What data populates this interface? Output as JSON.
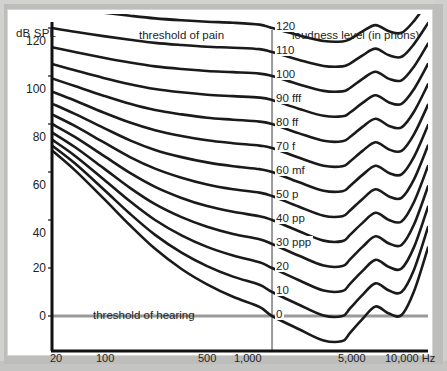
{
  "figure": {
    "axis_title_y": "dB SPL",
    "annotation_pain": "threshold of pain",
    "annotation_hearing": "threshold of hearing",
    "legend_title": "loudness level (in phons)",
    "colors": {
      "curve": "#1a1a1a",
      "axis": "#111111",
      "guide": "#9a9a9a",
      "plate": "#ffffff",
      "surround": "#c9c9c7",
      "text": "#232323"
    }
  },
  "chart_data": {
    "type": "line",
    "title": "",
    "subtitle": "",
    "xlabel": "",
    "ylabel": "dB SPL",
    "xscale": "log",
    "xlim": [
      20,
      16000
    ],
    "ylim": [
      -10,
      130
    ],
    "grid": false,
    "legend_position": "inline-right",
    "annotations": [
      {
        "text": "threshold of pain",
        "x": 260,
        "y": 125
      },
      {
        "text": "threshold of hearing",
        "x": 200,
        "y": 3
      },
      {
        "text": "loudness level (in phons)",
        "x": 3000,
        "y": 128
      }
    ],
    "xticks": [
      20,
      100,
      500,
      1000,
      5000,
      10000
    ],
    "xticklabels": [
      "20",
      "100",
      "500",
      "1,000",
      "5,000",
      "10,000 Hz"
    ],
    "yticks": [
      0,
      20,
      40,
      60,
      80,
      100,
      120
    ],
    "yticklabels": [
      "0",
      "20",
      "40",
      "60",
      "80",
      "100",
      "120"
    ],
    "guide_line_y": 0,
    "guide_line_x": 1000,
    "series": [
      {
        "name": "120",
        "label": "120",
        "dynamic": "",
        "phon": 120,
        "x": [
          20,
          30,
          50,
          80,
          125,
          200,
          315,
          500,
          800,
          1000,
          1600,
          2500,
          3500,
          4000,
          5000,
          6300,
          8000,
          10000,
          12500,
          16000
        ],
        "y": [
          129.5,
          128.0,
          126.4,
          125.1,
          124.0,
          123.2,
          122.6,
          122.2,
          121.4,
          120.0,
          117.0,
          114.6,
          114.4,
          115.4,
          118.6,
          121.2,
          118.6,
          118.0,
          123.0,
          131.0
        ]
      },
      {
        "name": "110",
        "label": "110",
        "dynamic": "",
        "phon": 110,
        "x": [
          20,
          30,
          50,
          80,
          125,
          200,
          315,
          500,
          800,
          1000,
          1600,
          2500,
          3500,
          4000,
          5000,
          6300,
          8000,
          10000,
          12500,
          16000
        ],
        "y": [
          120.0,
          118.4,
          116.6,
          115.1,
          113.8,
          112.9,
          112.2,
          111.8,
          111.2,
          110.0,
          106.8,
          104.2,
          104.0,
          105.2,
          108.6,
          111.4,
          108.6,
          108.0,
          113.4,
          122.0
        ]
      },
      {
        "name": "100",
        "label": "100",
        "dynamic": "",
        "phon": 100,
        "x": [
          20,
          30,
          50,
          80,
          125,
          200,
          315,
          500,
          800,
          1000,
          1600,
          2500,
          3500,
          4000,
          5000,
          6300,
          8000,
          10000,
          12500,
          16000
        ],
        "y": [
          112.0,
          110.0,
          107.6,
          105.6,
          104.0,
          102.9,
          102.1,
          101.6,
          101.0,
          100.0,
          96.6,
          93.8,
          93.6,
          95.0,
          98.8,
          101.8,
          98.8,
          98.2,
          104.0,
          113.5
        ]
      },
      {
        "name": "90",
        "label": "90 fff",
        "dynamic": "fff",
        "phon": 90,
        "x": [
          20,
          30,
          50,
          80,
          125,
          200,
          315,
          500,
          800,
          1000,
          1600,
          2500,
          3500,
          4000,
          5000,
          6300,
          8000,
          10000,
          12500,
          16000
        ],
        "y": [
          105.0,
          102.4,
          99.2,
          96.6,
          94.6,
          93.2,
          92.2,
          91.6,
          91.0,
          90.0,
          86.4,
          83.4,
          83.2,
          84.8,
          88.8,
          92.0,
          89.0,
          88.4,
          94.6,
          105.0
        ]
      },
      {
        "name": "80",
        "label": "80 ff",
        "dynamic": "ff",
        "phon": 80,
        "x": [
          20,
          30,
          50,
          80,
          125,
          200,
          315,
          500,
          800,
          1000,
          1600,
          2500,
          3500,
          4000,
          5000,
          6300,
          8000,
          10000,
          12500,
          16000
        ],
        "y": [
          99.0,
          95.8,
          91.8,
          88.4,
          85.8,
          84.0,
          82.6,
          81.8,
          81.0,
          80.0,
          76.2,
          73.0,
          72.8,
          74.6,
          78.8,
          82.2,
          79.2,
          78.6,
          85.2,
          96.5
        ]
      },
      {
        "name": "70",
        "label": "70 f",
        "dynamic": "f",
        "phon": 70,
        "x": [
          20,
          30,
          50,
          80,
          125,
          200,
          315,
          500,
          800,
          1000,
          1600,
          2500,
          3500,
          4000,
          5000,
          6300,
          8000,
          10000,
          12500,
          16000
        ],
        "y": [
          93.5,
          89.8,
          84.8,
          80.6,
          77.4,
          75.0,
          73.2,
          72.0,
          71.0,
          70.0,
          66.0,
          62.6,
          62.4,
          64.4,
          68.8,
          72.4,
          69.4,
          68.8,
          75.8,
          88.0
        ]
      },
      {
        "name": "60",
        "label": "60 mf",
        "dynamic": "mf",
        "phon": 60,
        "x": [
          20,
          30,
          50,
          80,
          125,
          200,
          315,
          500,
          800,
          1000,
          1600,
          2500,
          3500,
          4000,
          5000,
          6300,
          8000,
          10000,
          12500,
          16000
        ],
        "y": [
          88.5,
          84.2,
          78.4,
          73.2,
          69.2,
          66.2,
          64.0,
          62.4,
          61.2,
          60.0,
          55.8,
          52.2,
          52.0,
          54.2,
          58.8,
          62.6,
          59.6,
          59.0,
          66.4,
          79.5
        ]
      },
      {
        "name": "50",
        "label": "50 p",
        "dynamic": "p",
        "phon": 50,
        "x": [
          20,
          30,
          50,
          80,
          125,
          200,
          315,
          500,
          800,
          1000,
          1600,
          2500,
          3500,
          4000,
          5000,
          6300,
          8000,
          10000,
          12500,
          16000
        ],
        "y": [
          84.0,
          79.2,
          72.4,
          66.2,
          61.4,
          57.6,
          54.8,
          52.8,
          51.4,
          50.0,
          45.6,
          41.8,
          41.6,
          44.0,
          48.8,
          52.8,
          49.8,
          49.2,
          57.0,
          71.0
        ]
      },
      {
        "name": "40",
        "label": "40 pp",
        "dynamic": "pp",
        "phon": 40,
        "x": [
          20,
          30,
          50,
          80,
          125,
          200,
          315,
          500,
          800,
          1000,
          1600,
          2500,
          3500,
          4000,
          5000,
          6300,
          8000,
          10000,
          12500,
          16000
        ],
        "y": [
          80.0,
          74.6,
          66.8,
          59.6,
          53.8,
          49.2,
          45.8,
          43.4,
          41.6,
          40.0,
          35.4,
          31.4,
          31.2,
          33.8,
          38.8,
          43.0,
          40.0,
          39.4,
          47.6,
          62.5
        ]
      },
      {
        "name": "30",
        "label": "30 ppp",
        "dynamic": "ppp",
        "phon": 30,
        "x": [
          20,
          30,
          50,
          80,
          125,
          200,
          315,
          500,
          800,
          1000,
          1600,
          2500,
          3500,
          4000,
          5000,
          6300,
          8000,
          10000,
          12500,
          16000
        ],
        "y": [
          76.5,
          70.4,
          61.6,
          53.4,
          46.6,
          41.2,
          37.2,
          34.2,
          32.0,
          30.0,
          25.2,
          21.0,
          20.8,
          23.6,
          28.8,
          33.2,
          30.2,
          29.6,
          38.2,
          54.0
        ]
      },
      {
        "name": "20",
        "label": "20",
        "dynamic": "",
        "phon": 20,
        "x": [
          20,
          30,
          50,
          80,
          125,
          200,
          315,
          500,
          800,
          1000,
          1600,
          2500,
          3500,
          4000,
          5000,
          6300,
          8000,
          10000,
          12500,
          16000
        ],
        "y": [
          73.5,
          66.8,
          57.0,
          47.8,
          40.0,
          33.6,
          28.8,
          25.2,
          22.4,
          20.0,
          15.0,
          10.6,
          10.4,
          13.4,
          18.8,
          23.4,
          20.4,
          19.8,
          28.8,
          45.5
        ]
      },
      {
        "name": "10",
        "label": "10",
        "dynamic": "",
        "phon": 10,
        "x": [
          20,
          30,
          50,
          80,
          125,
          200,
          315,
          500,
          800,
          1000,
          1600,
          2500,
          3500,
          4000,
          5000,
          6300,
          8000,
          10000,
          12500,
          16000
        ],
        "y": [
          71.0,
          63.6,
          52.8,
          42.6,
          33.8,
          26.4,
          20.8,
          16.4,
          13.0,
          10.0,
          4.8,
          0.2,
          0.0,
          3.2,
          8.8,
          13.6,
          10.6,
          10.0,
          19.4,
          37.0
        ]
      },
      {
        "name": "0",
        "label": "0",
        "dynamic": "",
        "phon": 0,
        "x": [
          20,
          30,
          50,
          80,
          125,
          200,
          315,
          500,
          800,
          1000,
          1600,
          2500,
          3500,
          4000,
          5000,
          6300,
          8000,
          10000,
          12500,
          16000
        ],
        "y": [
          69.0,
          60.8,
          49.0,
          37.8,
          28.0,
          19.6,
          13.2,
          8.0,
          3.8,
          0.0,
          -5.4,
          -10.2,
          -10.4,
          -7.0,
          -1.2,
          4.0,
          1.0,
          0.4,
          10.4,
          28.5
        ]
      }
    ]
  },
  "axis_labels": {
    "y": [
      "120",
      "100",
      "80",
      "60",
      "40",
      "20",
      "0"
    ],
    "x": [
      "20",
      "100",
      "500",
      "1,000",
      "5,000",
      "10,000 Hz"
    ]
  }
}
